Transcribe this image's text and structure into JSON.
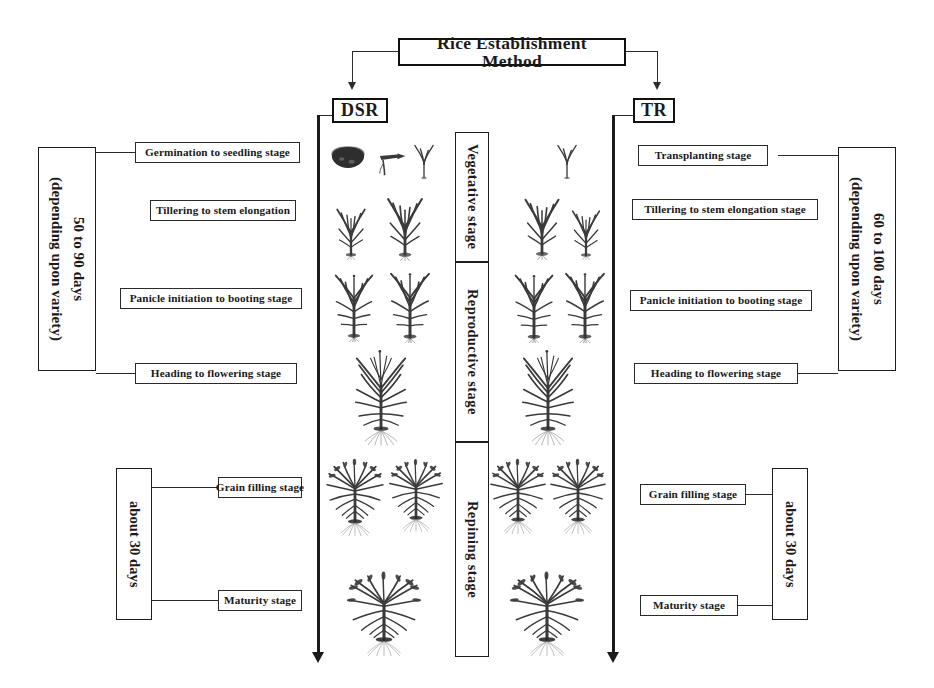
{
  "figure": {
    "title": "Rice Establishment Method",
    "root_label": "Rice Establishment Method",
    "methods": [
      {
        "id": "dsr",
        "label": "DSR"
      },
      {
        "id": "tr",
        "label": "TR"
      }
    ],
    "phases": [
      {
        "label": "Vegetative  stage"
      },
      {
        "label": "Reproductive  stage"
      },
      {
        "label": "Repining stage"
      }
    ],
    "left": {
      "duration_top": "50 to 90 days\n(depending upon variety)",
      "duration_bottom": "about 30 days",
      "stages": [
        "Germination to  seedling stage",
        "Tillering to stem elongation",
        "Panicle initiation to booting stage",
        "Heading to flowering stage",
        "Grain filling stage",
        "Maturity stage"
      ]
    },
    "right": {
      "duration_top": "60 to 100 days\n(depending upon variety)",
      "duration_bottom": "about 30 days",
      "stages": [
        "Transplanting stage",
        "Tillering  to stem elongation stage",
        "Panicle initiation to booting stage",
        "Heading to flowering stage",
        "Grain filling stage",
        "Maturity stage"
      ]
    },
    "colors": {
      "ink": "#1d1d1d",
      "line": "#2b2b2b",
      "plant": "#3a3a3a",
      "background": "#ffffff"
    }
  }
}
